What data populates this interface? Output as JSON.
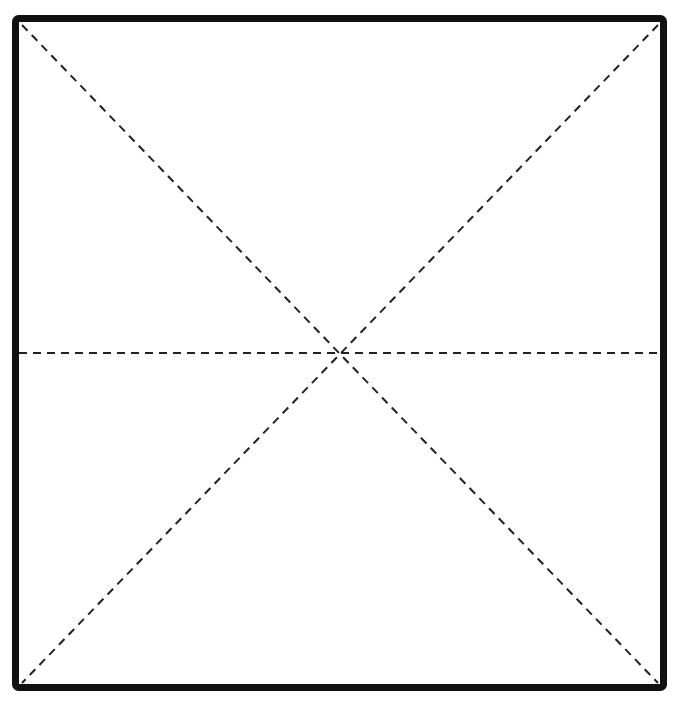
{
  "diagram": {
    "type": "square-with-fold-lines",
    "canvas": {
      "width": 677,
      "height": 703
    },
    "colors": {
      "background": "#ffffff",
      "border": "#111111",
      "dashed_line": "#222222"
    },
    "border": {
      "x": 15.5,
      "y": 18.5,
      "width": 648,
      "height": 669,
      "stroke_width": 7,
      "corner_radius": 3
    },
    "dashed_lines": [
      {
        "name": "diagonal-top-left-to-bottom-right",
        "x1": 22,
        "y1": 25,
        "x2": 658,
        "y2": 683
      },
      {
        "name": "diagonal-top-right-to-bottom-left",
        "x1": 658,
        "y1": 25,
        "x2": 22,
        "y2": 683
      },
      {
        "name": "horizontal-midline",
        "x1": 19,
        "y1": 353,
        "x2": 660,
        "y2": 353
      }
    ],
    "dash_pattern": "8 6",
    "dash_stroke_width": 2,
    "intersection": {
      "x": 340,
      "y": 353
    }
  }
}
